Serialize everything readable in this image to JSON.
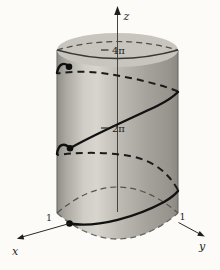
{
  "figure": {
    "labels": {
      "z_axis": "z",
      "x_axis": "x",
      "y_axis": "y",
      "tick_upper": "4π",
      "tick_lower": "2π",
      "x_unit": "1",
      "y_unit": "1"
    },
    "colors": {
      "curve": "#141414",
      "cylinder_highlight": "#d7d5ce",
      "cylinder_shadow": "#8a8880",
      "top_face": "#c7c5be",
      "background": "#fcfbf7",
      "axis": "#3a3a38"
    }
  }
}
